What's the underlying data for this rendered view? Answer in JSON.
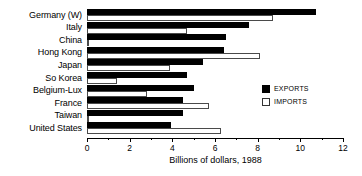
{
  "chart_data": {
    "type": "bar",
    "orientation": "horizontal",
    "title": "",
    "xlabel": "Billions of dollars, 1988",
    "ylabel": "",
    "xlim": [
      0,
      12
    ],
    "xticks": [
      0,
      2,
      4,
      6,
      8,
      10,
      12
    ],
    "xtick_labels": [
      "0",
      "2",
      "4",
      "6",
      "8",
      "10",
      "12"
    ],
    "minor_tick_step": 1,
    "grid": false,
    "legend_position": "center-right",
    "categories": [
      "Germany (W)",
      "Italy",
      "China",
      "Hong Kong",
      "Japan",
      "So Korea",
      "Belgium-Lux",
      "France",
      "Taiwan",
      "United States"
    ],
    "series": [
      {
        "name": "EXPORTS",
        "color": "#000000",
        "values": [
          10.75,
          7.6,
          6.5,
          6.4,
          5.45,
          4.7,
          5.0,
          4.5,
          4.5,
          3.95
        ]
      },
      {
        "name": "IMPORTS",
        "color": "#ffffff",
        "values": [
          8.7,
          4.7,
          0.1,
          8.1,
          3.9,
          1.4,
          2.8,
          5.7,
          0.1,
          6.3
        ]
      }
    ]
  },
  "axis": {
    "title": "Billions of dollars, 1988"
  },
  "legend": {
    "exports_label": "EXPORTS",
    "imports_label": "IMPORTS"
  }
}
